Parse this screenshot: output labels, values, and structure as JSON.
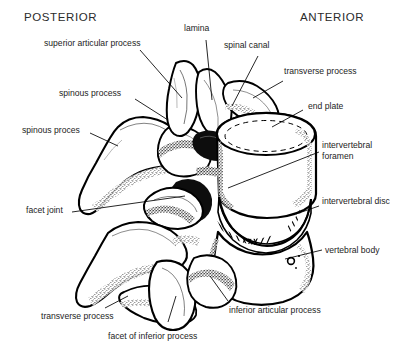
{
  "figure": {
    "background_color": "#ffffff",
    "ink_color": "#000000",
    "label_color": "#1d1d1d"
  },
  "orientation": {
    "posterior": "POSTERIOR",
    "anterior": "ANTERIOR"
  },
  "labels": {
    "superior_articular_process": "superior articular process",
    "spinous_process": "spinous process",
    "spinous_proces": "spinous proces",
    "facet_joint": "facet joint",
    "transverse_process_top": "transverse process",
    "transverse_process_bottom": "transverse process",
    "lamina": "lamina",
    "spinal_canal": "spinal canal",
    "end_plate": "end plate",
    "intervertebral_foramen": "intervertebral\nforamen",
    "intervertebral_disc": "intervertebral disc",
    "vertebral_body": "vertebral body",
    "inferior_articular_process": "inferior articular process",
    "facet_of_inferior_process": "facet of inferior process"
  }
}
